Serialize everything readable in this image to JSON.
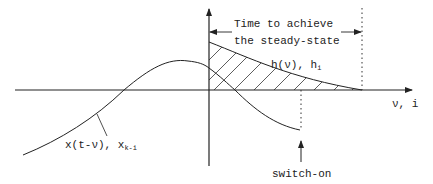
{
  "diagram": {
    "type": "convolution-illustration",
    "labels": {
      "steady_state_line1": "Time to achieve",
      "steady_state_line2": "the steady-state",
      "impulse_response": "h(ν), h",
      "impulse_response_sub": "i",
      "input_signal": "x(t-ν), x",
      "input_signal_sub": "k-i",
      "x_axis": "ν, i",
      "switch_on": "switch-on"
    },
    "colors": {
      "line": "#222222",
      "background": "#ffffff"
    },
    "curves": [
      {
        "name": "h(ν)",
        "description": "decaying impulse response starting at ν=0, hatched area underneath"
      },
      {
        "name": "x(t-ν)",
        "description": "time-reversed input signal, peaks just before ν=0, truncated at switch-on"
      }
    ],
    "markers": [
      {
        "name": "steady-state limit",
        "style": "dotted vertical line"
      },
      {
        "name": "switch-on",
        "style": "dotted vertical line with arrow"
      }
    ]
  }
}
